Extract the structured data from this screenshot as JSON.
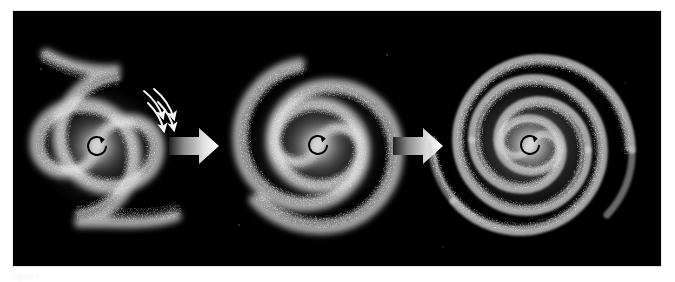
{
  "figure": {
    "panel_background": "#000000",
    "page_background": "#ffffff",
    "caption": "Figure 1",
    "panel": {
      "x": 13,
      "y": 11,
      "width": 648,
      "height": 255
    }
  },
  "colors": {
    "space_black": "#000000",
    "arm_bright": "#f4f4f4",
    "arm_mid": "#9a9a9a",
    "arm_dim": "#4a4a4a",
    "arrow_light": "#fdfdfd",
    "arrow_dark": "#1d1d1d",
    "rotation_marker": "#000000",
    "star_white": "#ffffff"
  },
  "stages": [
    {
      "id": "stage-1",
      "name": "open-two-arm-spiral",
      "label": "Open two-armed spiral",
      "center": {
        "x": 84,
        "y": 135
      },
      "radius": 78,
      "arm_count": 2,
      "turns": 0.72,
      "pitch_angle_deg": 28,
      "has_inflow_arrows": true,
      "rotation_direction": "counter-clockwise"
    },
    {
      "id": "stage-2",
      "name": "intermediate-wound-spiral",
      "label": "Intermediate wound spiral",
      "center": {
        "x": 305,
        "y": 134
      },
      "radius": 86,
      "arm_count": 2,
      "turns": 1.45,
      "pitch_angle_deg": 15,
      "has_inflow_arrows": false,
      "rotation_direction": "counter-clockwise"
    },
    {
      "id": "stage-3",
      "name": "tightly-wound-ring-spiral",
      "label": "Tightly wound ring-like spiral",
      "center": {
        "x": 517,
        "y": 134
      },
      "radius": 92,
      "arm_count": 2,
      "turns": 3.1,
      "pitch_angle_deg": 6,
      "has_inflow_arrows": false,
      "rotation_direction": "counter-clockwise"
    }
  ],
  "transition_arrows": [
    {
      "id": "arrow-1",
      "name": "stage-1-to-stage-2",
      "x": 168,
      "y": 133,
      "width": 50,
      "height": 34,
      "direction": "right",
      "gradient_from": "#242424",
      "gradient_to": "#ffffff"
    },
    {
      "id": "arrow-2",
      "name": "stage-2-to-stage-3",
      "x": 392,
      "y": 133,
      "width": 50,
      "height": 34,
      "direction": "right",
      "gradient_from": "#242424",
      "gradient_to": "#ffffff"
    }
  ],
  "inflow_arrows": {
    "count": 4,
    "color": "#f5f5f5",
    "description": "four curved arrows showing gas streaming inward along the leading edge of the outer arm"
  },
  "rotation_markers": {
    "glyph": "circular-arrow",
    "color": "#000000",
    "radius": 9,
    "description": "small counter-clockwise circular arrow drawn at each galaxy nucleus"
  }
}
